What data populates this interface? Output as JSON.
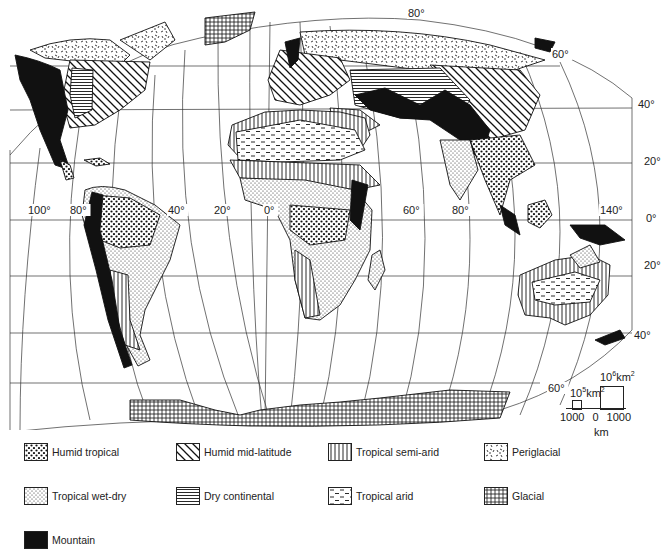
{
  "map": {
    "title": "World morphoclimatic zones",
    "projection": "interrupted equal-area (Eckert-like)",
    "longitude_labels": [
      {
        "text": "100°",
        "x": 28,
        "y": 214
      },
      {
        "text": "80°",
        "x": 70,
        "y": 214
      },
      {
        "text": "40°",
        "x": 168,
        "y": 214
      },
      {
        "text": "20°",
        "x": 214,
        "y": 214
      },
      {
        "text": "0°",
        "x": 264,
        "y": 214
      },
      {
        "text": "60°",
        "x": 403,
        "y": 214
      },
      {
        "text": "80°",
        "x": 452,
        "y": 214
      },
      {
        "text": "140°",
        "x": 600,
        "y": 214
      }
    ],
    "latitude_labels": [
      {
        "text": "80°",
        "x": 408,
        "y": 17
      },
      {
        "text": "60°",
        "x": 552,
        "y": 58
      },
      {
        "text": "40°",
        "x": 638,
        "y": 108
      },
      {
        "text": "20°",
        "x": 644,
        "y": 165
      },
      {
        "text": "0°",
        "x": 646,
        "y": 222
      },
      {
        "text": "20°",
        "x": 644,
        "y": 269
      },
      {
        "text": "40°",
        "x": 634,
        "y": 339
      },
      {
        "text": "60°",
        "x": 548,
        "y": 392
      }
    ],
    "scale": {
      "small_box_label_base": "10",
      "small_box_label_exp": "5",
      "small_box_unit": "km",
      "small_box_unit_exp": "2",
      "large_box_label_base": "10",
      "large_box_label_exp": "6",
      "large_box_unit": "km",
      "large_box_unit_exp": "2",
      "ticks": [
        "1000",
        "0",
        "1000"
      ],
      "unit": "km"
    }
  },
  "legend": {
    "items": [
      {
        "key": "humid-tropical",
        "label": "Humid tropical",
        "pattern": "dots-coarse"
      },
      {
        "key": "humid-mid-latitude",
        "label": "Humid mid-latitude",
        "pattern": "diagonal"
      },
      {
        "key": "tropical-semi-arid",
        "label": "Tropical semi-arid",
        "pattern": "vertical"
      },
      {
        "key": "periglacial",
        "label": "Periglacial",
        "pattern": "dashes-random"
      },
      {
        "key": "tropical-wet-dry",
        "label": "Tropical wet-dry",
        "pattern": "dots-fine"
      },
      {
        "key": "dry-continental",
        "label": "Dry continental",
        "pattern": "horizontal"
      },
      {
        "key": "tropical-arid",
        "label": "Tropical arid",
        "pattern": "dashes"
      },
      {
        "key": "glacial",
        "label": "Glacial",
        "pattern": "grid"
      },
      {
        "key": "mountain",
        "label": "Mountain",
        "pattern": "solid"
      }
    ]
  },
  "colors": {
    "ink": "#1a1a1a",
    "paper": "#ffffff",
    "grid": "#333333"
  }
}
